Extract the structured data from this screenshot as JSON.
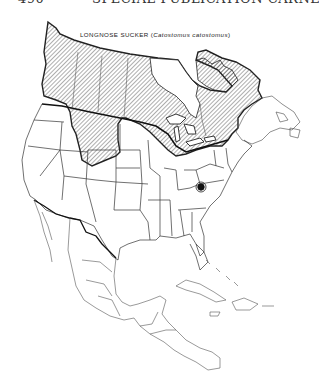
{
  "page_header": {
    "page_number": "490",
    "running_title": "SPECIAL PUBLICATION CARNEGIE"
  },
  "map": {
    "title_common": "LONGNOSE SUCKER (",
    "title_scientific": "Catostomus catostomus",
    "title_close": ")",
    "region": "North America",
    "legend": {
      "hatched_area": "native range",
      "circled_dot": "disjunct population"
    },
    "colors": {
      "outline": "#222222",
      "hatch": "#333333",
      "border": "#555555",
      "background": "#ffffff"
    }
  }
}
